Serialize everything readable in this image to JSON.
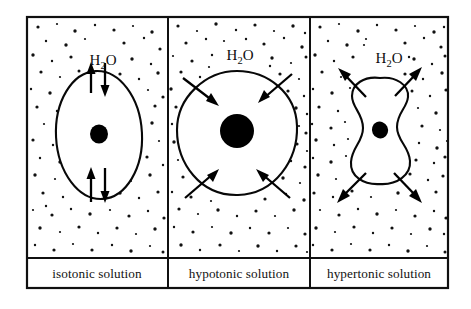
{
  "figure": {
    "frame": {
      "x": 27,
      "y": 17,
      "width": 421,
      "height": 271,
      "stroke": "#101010",
      "stroke_width": 2.2
    },
    "caption_divider_y": 258,
    "panel_dividers_x": [
      168,
      310
    ],
    "colors": {
      "ink": "#000000",
      "line": "#101010",
      "background": "#ffffff",
      "nucleus": "#000000",
      "stipple": "#111111"
    }
  },
  "panels": [
    {
      "id": "isotonic",
      "caption": "isotonic solution",
      "formula_label": {
        "element": "H",
        "subscript": "2",
        "element2": "O"
      },
      "formula_text": "H2O",
      "bounds": {
        "x": 27,
        "y": 17,
        "width": 141,
        "height": 241
      },
      "caption_center_x": 97,
      "formula_center": {
        "x": 103,
        "y": 60
      },
      "cell": {
        "shape": "oval",
        "center": {
          "x": 99,
          "y": 135
        },
        "radius_x": 43,
        "radius_y": 64,
        "interior_stipple_density": "equal-to-exterior"
      },
      "nucleus": {
        "center": {
          "x": 99,
          "y": 134
        },
        "radius_x": 9,
        "radius_y": 9.5
      },
      "arrows": [
        {
          "name": "top-outward-arrow",
          "direction": "up",
          "x": 91,
          "from_y": 93,
          "to_y": 63
        },
        {
          "name": "top-inward-arrow",
          "direction": "down",
          "x": 105,
          "from_y": 63,
          "to_y": 96
        },
        {
          "name": "bottom-outward-arrow",
          "direction": "up",
          "x": 91,
          "from_y": 202,
          "to_y": 168
        },
        {
          "name": "bottom-inward-arrow",
          "direction": "down",
          "x": 105,
          "from_y": 168,
          "to_y": 202
        }
      ],
      "net_water_movement": "none (equal in and out)"
    },
    {
      "id": "hypotonic",
      "caption": "hypotonic solution",
      "formula_label": {
        "element": "H",
        "subscript": "2",
        "element2": "O"
      },
      "formula_text": "H2O",
      "bounds": {
        "x": 168,
        "y": 17,
        "width": 142,
        "height": 241
      },
      "caption_center_x": 239,
      "formula_center": {
        "x": 240,
        "y": 55
      },
      "cell": {
        "shape": "swollen-circle",
        "center": {
          "x": 237,
          "y": 133
        },
        "radius_x": 60,
        "radius_y": 62,
        "interior_stipple_density": "dense"
      },
      "nucleus": {
        "center": {
          "x": 237,
          "y": 131
        },
        "radius_x": 17,
        "radius_y": 17
      },
      "arrows": [
        {
          "name": "top-left-inward-arrow",
          "direction": "down-right",
          "from": {
            "x": 183,
            "y": 78
          },
          "to": {
            "x": 218,
            "y": 105
          }
        },
        {
          "name": "top-right-inward-arrow",
          "direction": "down-left",
          "from": {
            "x": 292,
            "y": 74
          },
          "to": {
            "x": 259,
            "y": 102
          }
        },
        {
          "name": "bottom-left-inward-arrow",
          "direction": "up-right",
          "from": {
            "x": 185,
            "y": 198
          },
          "to": {
            "x": 218,
            "y": 170
          }
        },
        {
          "name": "bottom-right-inward-arrow",
          "direction": "up-left",
          "from": {
            "x": 290,
            "y": 198
          },
          "to": {
            "x": 257,
            "y": 170
          }
        }
      ],
      "net_water_movement": "into the cell (cell swells)"
    },
    {
      "id": "hypertonic",
      "caption": "hypertonic solution",
      "formula_label": {
        "element": "H",
        "subscript": "2",
        "element2": "O"
      },
      "formula_text": "H2O",
      "bounds": {
        "x": 310,
        "y": 17,
        "width": 138,
        "height": 241
      },
      "caption_center_x": 379,
      "formula_center": {
        "x": 389,
        "y": 58
      },
      "cell": {
        "shape": "crenated-shrunken",
        "center": {
          "x": 380,
          "y": 135
        },
        "radius_x": 33,
        "radius_y": 58,
        "interior_stipple_density": "sparse"
      },
      "nucleus": {
        "center": {
          "x": 380,
          "y": 130
        },
        "radius_x": 8,
        "radius_y": 8.5
      },
      "arrows": [
        {
          "name": "top-left-outward-arrow",
          "direction": "up-left",
          "from": {
            "x": 366,
            "y": 97
          },
          "to": {
            "x": 339,
            "y": 69
          }
        },
        {
          "name": "top-right-outward-arrow",
          "direction": "up-right",
          "from": {
            "x": 395,
            "y": 96
          },
          "to": {
            "x": 421,
            "y": 68
          }
        },
        {
          "name": "bottom-left-outward-arrow",
          "direction": "down-left",
          "from": {
            "x": 366,
            "y": 173
          },
          "to": {
            "x": 338,
            "y": 202
          }
        },
        {
          "name": "bottom-right-outward-arrow",
          "direction": "down-right",
          "from": {
            "x": 394,
            "y": 173
          },
          "to": {
            "x": 421,
            "y": 202
          }
        }
      ],
      "net_water_movement": "out of the cell (cell shrinks)"
    }
  ]
}
